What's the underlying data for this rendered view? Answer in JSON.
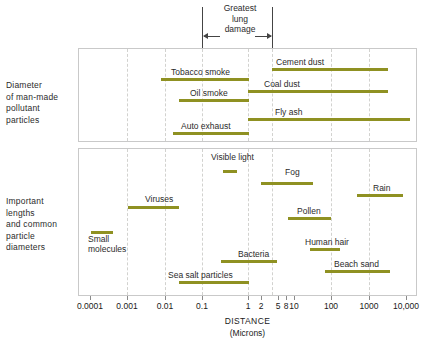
{
  "chart_data": {
    "type": "bar",
    "orientation": "horizontal-range",
    "title": "",
    "xlabel": "DISTANCE",
    "xunits": "(Microns)",
    "xscale": "log",
    "xlim": [
      0.0001,
      10000
    ],
    "grid": true,
    "legend": null,
    "tick_labels": [
      "0.0001",
      "0.001",
      "0.01",
      "0.1",
      "1",
      "2",
      "5",
      "8",
      "10",
      "100",
      "1000",
      "10,000"
    ],
    "tick_values": [
      0.0001,
      0.001,
      0.01,
      0.1,
      1,
      2,
      5,
      8,
      10,
      100,
      1000,
      10000
    ],
    "annotation": {
      "text": "Greatest\nlung\ndamage",
      "range": [
        0.1,
        3.0
      ]
    },
    "panels": [
      {
        "name": "upper",
        "label": "Diameter\nof man-made\npollutant\nparticles",
        "series": [
          {
            "name": "Cement dust",
            "range": [
              3.0,
              100.0
            ],
            "label_side": "above-right"
          },
          {
            "name": "Tobacco smoke",
            "range": [
              0.01,
              1.0
            ],
            "label_side": "above-right"
          },
          {
            "name": "Coal dust",
            "range": [
              1.0,
              100.0
            ],
            "label_side": "above-right"
          },
          {
            "name": "Oil smoke",
            "range": [
              0.03,
              1.0
            ],
            "label_side": "above-right"
          },
          {
            "name": "Fly ash",
            "range": [
              1.0,
              1000.0
            ],
            "label_side": "above-right"
          },
          {
            "name": "Auto exhaust",
            "range": [
              0.02,
              1.0
            ],
            "label_side": "above-right"
          }
        ]
      },
      {
        "name": "lower",
        "label": "Important\nlengths\nand common\nparticle\ndiameters",
        "series": [
          {
            "name": "Visible light",
            "range": [
              0.4,
              0.75
            ],
            "label_side": "above"
          },
          {
            "name": "Fog",
            "range": [
              2.0,
              40.0
            ],
            "label_side": "above"
          },
          {
            "name": "Rain",
            "range": [
              500.0,
              5000.0
            ],
            "label_side": "above"
          },
          {
            "name": "Viruses",
            "range": [
              0.003,
              0.05
            ],
            "label_side": "above"
          },
          {
            "name": "Pollen",
            "range": [
              10.0,
              100.0
            ],
            "label_side": "above"
          },
          {
            "name": "Small molecules",
            "range": [
              0.0003,
              0.0007
            ],
            "label_side": "below"
          },
          {
            "name": "Human hair",
            "range": [
              30.0,
              200.0
            ],
            "label_side": "above"
          },
          {
            "name": "Bacteria",
            "range": [
              0.3,
              20.0
            ],
            "label_side": "above"
          },
          {
            "name": "Beach sand",
            "range": [
              100.0,
              2500.0
            ],
            "label_side": "above"
          },
          {
            "name": "Sea salt particles",
            "range": [
              0.03,
              1.0
            ],
            "label_side": "above"
          }
        ]
      }
    ],
    "colors": {
      "bar": "#8f9122",
      "band": "#e2e3a8",
      "grid": "#d2d2cf",
      "panel_border": "#c9c9c9",
      "text": "#1a1a1a",
      "background": "#ffffff"
    }
  },
  "labels": {
    "upper_panel_side": "Diameter\nof man-made\npollutant\nparticles",
    "lower_panel_side": "Important\nlengths\nand common\nparticle\ndiameters",
    "annotation": "Greatest\nlung\ndamage",
    "axis_title": "DISTANCE",
    "axis_units": "(Microns)"
  },
  "bars_upper": [
    {
      "name": "Cement dust",
      "left": 272,
      "width": 116,
      "top": 68,
      "label_x": 276,
      "label_y": 57
    },
    {
      "name": "Tobacco smoke",
      "left": 161,
      "width": 88,
      "top": 78,
      "label_x": 171,
      "label_y": 67
    },
    {
      "name": "Coal dust",
      "left": 248,
      "width": 140,
      "top": 90,
      "label_x": 264,
      "label_y": 79
    },
    {
      "name": "Oil smoke",
      "left": 179,
      "width": 70,
      "top": 99,
      "label_x": 190,
      "label_y": 88
    },
    {
      "name": "Fly ash",
      "left": 248,
      "width": 162,
      "top": 118,
      "label_x": 275,
      "label_y": 107
    },
    {
      "name": "Auto exhaust",
      "left": 173,
      "width": 76,
      "top": 132,
      "label_x": 181,
      "label_y": 121
    }
  ],
  "bars_lower": [
    {
      "name": "Visible light",
      "left": 223,
      "width": 14,
      "top": 170,
      "label_x": 211,
      "label_y": 152
    },
    {
      "name": "Fog",
      "left": 261,
      "width": 52,
      "top": 182,
      "label_x": 285,
      "label_y": 167
    },
    {
      "name": "Rain",
      "left": 357,
      "width": 46,
      "top": 194,
      "label_x": 373,
      "label_y": 183
    },
    {
      "name": "Viruses",
      "left": 128,
      "width": 51,
      "top": 206,
      "label_x": 145,
      "label_y": 194
    },
    {
      "name": "Pollen",
      "left": 288,
      "width": 43,
      "top": 217,
      "label_x": 297,
      "label_y": 206
    },
    {
      "name": "Small molecules",
      "left": 91,
      "width": 22,
      "top": 231,
      "label_x": 88,
      "label_y": 234
    },
    {
      "name": "Human hair",
      "left": 310,
      "width": 30,
      "top": 248,
      "label_x": 305,
      "label_y": 237
    },
    {
      "name": "Bacteria",
      "left": 221,
      "width": 56,
      "top": 260,
      "label_x": 238,
      "label_y": 249
    },
    {
      "name": "Beach sand",
      "left": 325,
      "width": 65,
      "top": 270,
      "label_x": 334,
      "label_y": 259
    },
    {
      "name": "Sea salt particles",
      "left": 179,
      "width": 70,
      "top": 281,
      "label_x": 168,
      "label_y": 270
    }
  ],
  "ticks": [
    {
      "label": "0.0001",
      "x": 90
    },
    {
      "label": "0.001",
      "x": 127
    },
    {
      "label": "0.01",
      "x": 165
    },
    {
      "label": "0.1",
      "x": 202
    },
    {
      "label": "1",
      "x": 248
    },
    {
      "label": "2",
      "x": 261
    },
    {
      "label": "5",
      "x": 278
    },
    {
      "label": "8",
      "x": 286
    },
    {
      "label": "10",
      "x": 294
    },
    {
      "label": "100",
      "x": 331
    },
    {
      "label": "1000",
      "x": 369
    },
    {
      "label": "10,000",
      "x": 406
    }
  ],
  "gridlines_upper": [
    127,
    165,
    202,
    248,
    272,
    331,
    369
  ],
  "gridlines_lower": [
    127,
    165,
    202,
    248,
    272,
    331,
    369
  ]
}
